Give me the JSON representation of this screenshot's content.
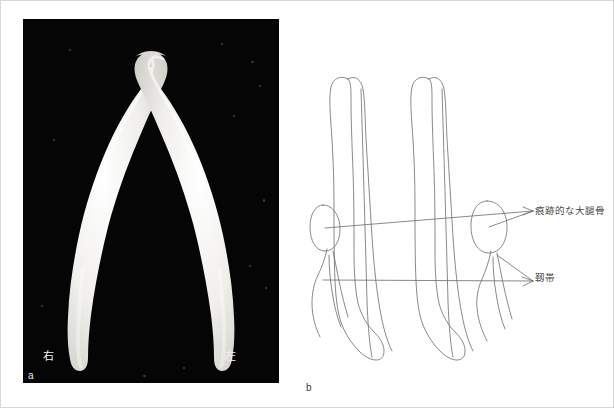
{
  "figure": {
    "panels": [
      {
        "letter": "a",
        "kind": "photograph",
        "background_color": "#050505",
        "specimen_color": "#f4f4f2",
        "labels": [
          {
            "name": "right",
            "text": "右"
          },
          {
            "name": "left",
            "text": "左"
          }
        ]
      },
      {
        "letter": "b",
        "kind": "line-diagram",
        "line_color": "#6b6b6b",
        "labels": [
          {
            "name": "right",
            "text": "右"
          },
          {
            "name": "left",
            "text": "左"
          }
        ],
        "annotations": [
          {
            "name": "vestigial-femur",
            "text": "痕跡的な大腿骨"
          },
          {
            "name": "ligament",
            "text": "靱帯"
          }
        ]
      }
    ]
  },
  "colors": {
    "border": "#d8d8d8",
    "photo_background": "#050505",
    "bone_white": "#f4f4f2",
    "diagram_stroke": "#6b6b6b",
    "text_dark": "#4a4a4a",
    "text_light": "#f2f2f2"
  }
}
